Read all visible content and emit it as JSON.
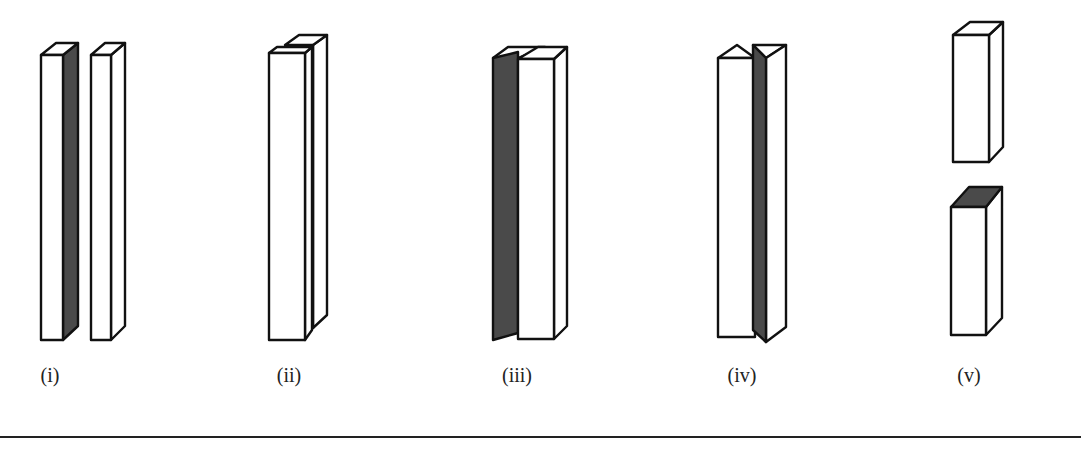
{
  "figure": {
    "panels": [
      {
        "id": "i",
        "label": "(i)",
        "label_x": 50,
        "description": "two separate tall rectangular prisms side by side; left prism has shaded right face"
      },
      {
        "id": "ii",
        "label": "(ii)",
        "label_x": 289,
        "description": "two tall prisms, one behind the other, offset diagonally; back prism side shaded"
      },
      {
        "id": "iii",
        "label": "(iii)",
        "label_x": 517,
        "description": "two thin panels joined at the top in a V arrangement; shaded panel leans left behind white prism"
      },
      {
        "id": "iv",
        "label": "(iv)",
        "label_x": 742,
        "description": "white prism with pointed top next to a triangular prism with shaded left face"
      },
      {
        "id": "v",
        "label": "(v)",
        "label_x": 969,
        "description": "two short rectangular blocks stacked vertically with a gap; lower block has shaded top face"
      }
    ]
  },
  "colors": {
    "outline": "#111111",
    "shade": "#4a4a4a",
    "face": "#ffffff",
    "rule": "#222222"
  }
}
